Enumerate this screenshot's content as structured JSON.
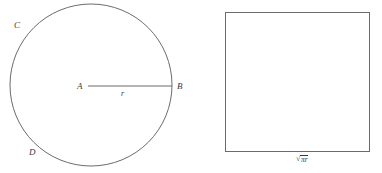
{
  "figure": {
    "background_color": "#ffffff",
    "stroke_color": "#6b6b6b",
    "text_color": "#3a3a3a"
  },
  "circle": {
    "center_label": "A",
    "edge_label": "B",
    "arc_label_upper": "C",
    "arc_label_lower": "D",
    "radius_label": "r",
    "center_x": 91,
    "center_y": 85,
    "radius": 81
  },
  "square": {
    "side_label_radical": "√",
    "side_label_radicand": "πr",
    "side_label_full": "√πr",
    "x": 225,
    "y": 12,
    "width": 145,
    "height": 140
  }
}
